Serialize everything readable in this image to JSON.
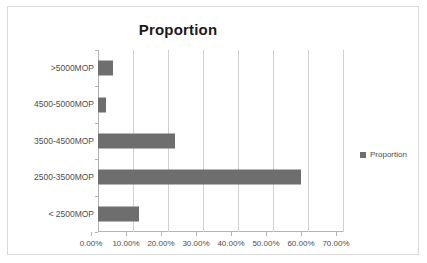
{
  "chart_data": {
    "type": "bar",
    "orientation": "horizontal",
    "title": "Proportion",
    "xlabel": "",
    "ylabel": "",
    "categories": [
      ">5000MOP",
      "4500-5000MOP",
      "3500-4500MOP",
      "2500-3500MOP",
      "< 2500MOP"
    ],
    "values": [
      4.3,
      2.3,
      22.0,
      58.0,
      11.7
    ],
    "value_unit": "%",
    "series": [
      {
        "name": "Proportion",
        "values": [
          4.3,
          2.3,
          22.0,
          58.0,
          11.7
        ]
      }
    ],
    "xlim": [
      0,
      70
    ],
    "xticks": [
      0,
      10,
      20,
      30,
      40,
      50,
      60,
      70
    ],
    "xtick_labels": [
      "0.00%",
      "10.00%",
      "20.00%",
      "30.00%",
      "40.00%",
      "50.00%",
      "60.00%",
      "70.00%"
    ],
    "grid": "vertical",
    "legend_position": "right",
    "legend_entries": [
      "Proportion"
    ],
    "bar_color": "#6e6e6e",
    "gridline_color": "#d0d0d0",
    "axis_color": "#b3b3b3",
    "frame_color": "#d9d9d9",
    "title_color": "#1a1a1a",
    "label_color": "#4d4d4d"
  }
}
